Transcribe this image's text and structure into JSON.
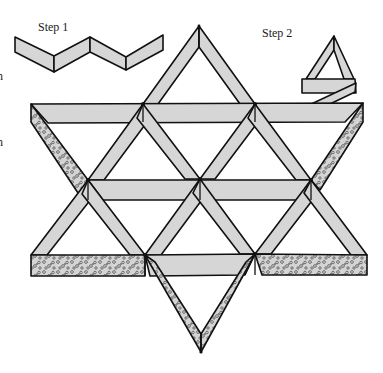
{
  "figure": {
    "labels": {
      "step1": "Step 1",
      "step2": "Step 2",
      "edge_cut_1": "n",
      "edge_cut_2": "n"
    },
    "colors": {
      "strip_fill": "#d6d6d6",
      "outline": "#111111",
      "speckle": "#555555",
      "background": "#ffffff"
    },
    "steps": [
      {
        "name": "Step 1",
        "shape": "zigzag folded strip"
      },
      {
        "name": "Step 2",
        "shape": "strip folded into triangle"
      }
    ],
    "main_figure": {
      "shape": "six-pointed star lattice of woven strips",
      "horizontal_bands": 3,
      "speckled_segments": [
        "upper-left edge",
        "upper-right edge",
        "lower-left band",
        "lower-right band",
        "bottom point"
      ]
    }
  }
}
